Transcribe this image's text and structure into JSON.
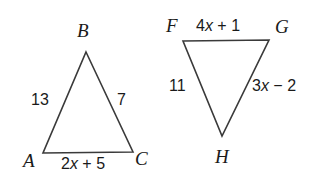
{
  "figure": {
    "background_color": "#ffffff",
    "stroke_color": "#3a3a3a",
    "text_color": "#1a1a1a",
    "stroke_width": 1.6
  },
  "triangles": [
    {
      "name": "triangle-abc",
      "vertices": [
        {
          "label": "B",
          "x": 86,
          "y": 52
        },
        {
          "label": "C",
          "x": 133,
          "y": 152
        },
        {
          "label": "A",
          "x": 43,
          "y": 153
        }
      ],
      "points_attr": "86,52 133,152 43,153",
      "side_labels": [
        {
          "name": "side-ab",
          "text": "13"
        },
        {
          "name": "side-bc",
          "text": "7"
        }
      ],
      "side_expressions": [
        {
          "name": "side-ac",
          "lead": "2",
          "var": "x",
          "operator": " + ",
          "trail": "5",
          "text": "2x + 5"
        }
      ]
    },
    {
      "name": "triangle-fgh",
      "vertices": [
        {
          "label": "F",
          "x": 183,
          "y": 41
        },
        {
          "label": "G",
          "x": 269,
          "y": 40
        },
        {
          "label": "H",
          "x": 222,
          "y": 136
        }
      ],
      "points_attr": "183,41 269,40 222,136",
      "side_labels": [
        {
          "name": "side-fh",
          "text": "11"
        }
      ],
      "side_expressions": [
        {
          "name": "side-fg",
          "lead": "4",
          "var": "x",
          "operator": " + ",
          "trail": "1",
          "text": "4x + 1"
        },
        {
          "name": "side-gh",
          "lead": "3",
          "var": "x",
          "operator": " − ",
          "trail": "2",
          "text": "3x − 2"
        }
      ]
    }
  ]
}
